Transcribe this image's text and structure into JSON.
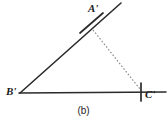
{
  "figure": {
    "caption": "(b)",
    "background_color": "#ffffff",
    "stroke_color": "#2b2b2b",
    "dashed_stroke_color": "#8d8d8d",
    "labels": {
      "a": "A'",
      "b": "B'",
      "c": "C'"
    },
    "geometry": {
      "type": "diagram",
      "description": "Triangle construction: ray from B' through A' extended, base line through B' and C' extended, dashed segment A'C', arc tick at A', tick mark at C'",
      "points": {
        "A": [
          91,
          26
        ],
        "B": [
          20,
          93
        ],
        "C": [
          141,
          92
        ]
      },
      "ray_BA_extended_end": [
        121,
        3
      ],
      "base_line": {
        "from": [
          19,
          93
        ],
        "to": [
          166,
          92
        ]
      },
      "dashed_segment": {
        "from": [
          93,
          30
        ],
        "to": [
          140,
          89
        ]
      },
      "arc_tick_at_A": {
        "from": [
          80,
          33
        ],
        "to": [
          103,
          13
        ]
      },
      "tick_at_C": {
        "x": 141,
        "y_top": 83,
        "y_bottom": 101
      }
    }
  }
}
